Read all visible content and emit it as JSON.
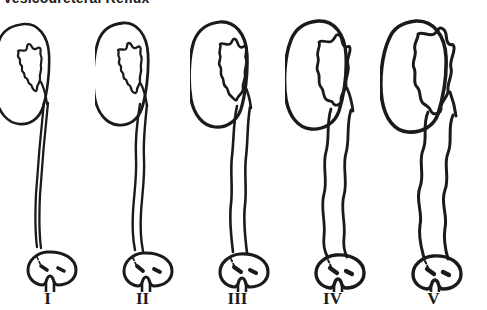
{
  "figure": {
    "title": "Vesicoureteral Reflux",
    "background_color": "#ffffff",
    "line_color": "#1a1a1a",
    "type": "medical-illustration",
    "panel_count": 5
  },
  "panels": [
    {
      "label": "I",
      "grade": 1,
      "ureter_description": "reflux into non-dilated distal ureter only",
      "ureter_width_px": 4,
      "ureter_tortuosity": "straight",
      "calyces": "sharp pointed fornices",
      "kidney_size": "normal",
      "bladder": "normal dome with two ureteral orifices and urethra"
    },
    {
      "label": "II",
      "grade": 2,
      "ureter_description": "reflux into ureter, pelvis and calyces without dilatation",
      "ureter_width_px": 7,
      "ureter_tortuosity": "slightly wavy",
      "calyces": "sharp fornices preserved",
      "kidney_size": "normal",
      "bladder": "normal dome with two ureteral orifices and urethra"
    },
    {
      "label": "III",
      "grade": 3,
      "ureter_description": "mild to moderate dilatation of ureter with mild pelvic dilatation",
      "ureter_width_px": 12,
      "ureter_tortuosity": "mildly tortuous",
      "calyces": "mild blunting of fornices",
      "kidney_size": "slightly enlarged",
      "bladder": "normal dome with two ureteral orifices and urethra"
    },
    {
      "label": "IV",
      "grade": 4,
      "ureter_description": "moderate dilatation and tortuosity of ureter with moderate pelvicalyceal dilatation",
      "ureter_width_px": 17,
      "ureter_tortuosity": "moderately tortuous",
      "calyces": "blunted fornices, papillary impressions preserved",
      "kidney_size": "enlarged",
      "bladder": "normal dome with two ureteral orifices and urethra"
    },
    {
      "label": "V",
      "grade": 5,
      "ureter_description": "gross dilatation and tortuosity of ureter with severe pelvicalyceal dilatation",
      "ureter_width_px": 21,
      "ureter_tortuosity": "grossly tortuous",
      "calyces": "papillary impressions lost, calyces ballooned",
      "kidney_size": "grossly enlarged",
      "bladder": "normal dome with two ureteral orifices and urethra"
    }
  ]
}
